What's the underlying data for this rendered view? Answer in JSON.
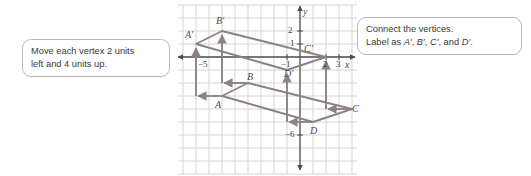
{
  "figure": {
    "colors": {
      "grid": "#d8d3cf",
      "axis": "#4a4a4a",
      "shape": "#8d8286",
      "arrow": "#8d8286",
      "callout_border": "#b9b9b9",
      "text": "#3a3a3a"
    },
    "grid": {
      "origin_px": [
        300,
        57
      ],
      "unit_px": 13,
      "x_range": [
        -9,
        4
      ],
      "y_range": [
        -7,
        3
      ]
    },
    "axes": {
      "x_axis_label": "x",
      "y_axis_label": "y",
      "x_ticks": [
        {
          "value": -5,
          "label": "−5"
        },
        {
          "value": -1,
          "label": "−1"
        },
        {
          "value": 2,
          "label": "2"
        },
        {
          "value": 3,
          "label": "3"
        }
      ],
      "y_ticks": [
        {
          "value": 2,
          "label": "2"
        },
        {
          "value": 1,
          "label": "1"
        },
        {
          "value": -6,
          "label": "−6"
        }
      ]
    },
    "preimage": {
      "name": "ABCD",
      "vertices": [
        {
          "label": "A",
          "x": -6,
          "y": -3
        },
        {
          "label": "B",
          "x": -4,
          "y": -2
        },
        {
          "label": "C",
          "x": 4,
          "y": -4
        },
        {
          "label": "D",
          "x": 1,
          "y": -5
        }
      ]
    },
    "image": {
      "name": "A'B'C'D'",
      "vertices": [
        {
          "label": "A′",
          "x": -8,
          "y": 1
        },
        {
          "label": "B′",
          "x": -6,
          "y": 2
        },
        {
          "label": "C′",
          "x": 2,
          "y": 0
        },
        {
          "label": "D′",
          "x": -1,
          "y": -1
        }
      ]
    },
    "translation": {
      "dx": -2,
      "dy": 4
    }
  },
  "callouts": {
    "left": {
      "line1": "Move each vertex 2 units",
      "line2": "left and 4 units up."
    },
    "right": {
      "line1": "Connect the vertices.",
      "line2_prefix": "Label as ",
      "label_a": "A′",
      "label_b": "B′",
      "label_c": "C′",
      "label_d": "D′",
      "sep": ", ",
      "and": ", and ",
      "end": "."
    }
  }
}
